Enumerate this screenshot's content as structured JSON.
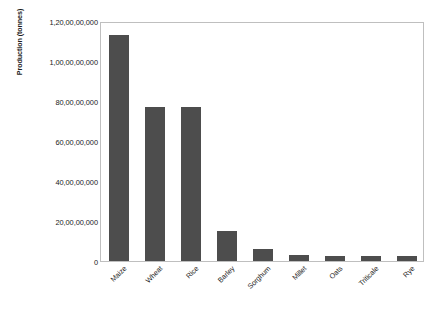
{
  "chart_data": {
    "type": "bar",
    "title": "",
    "xlabel": "",
    "ylabel": "Production (tonnes)",
    "categories": [
      "Maize",
      "Wheat",
      "Rice",
      "Barley",
      "Sorghum",
      "Millet",
      "Oats",
      "Triticale",
      "Rye"
    ],
    "values": [
      11300000000,
      7700000000,
      7700000000,
      1500000000,
      600000000,
      300000000,
      250000000,
      250000000,
      250000000
    ],
    "ylim": [
      0,
      12000000000
    ],
    "ytick_values": [
      0,
      2000000000,
      4000000000,
      6000000000,
      8000000000,
      10000000000,
      12000000000
    ],
    "ytick_labels": [
      "0",
      "20,00,00,000",
      "40,00,00,000",
      "60,00,00,000",
      "80,00,00,000",
      "1,00,00,00,000",
      "1,20,00,00,000"
    ],
    "grid": false,
    "legend": null,
    "bar_color": "#4d4d4d",
    "plot_border_color": "#bfbfbf"
  },
  "axes": {
    "y_title": "Production (tonnes)"
  },
  "caption": {
    "text": ""
  }
}
